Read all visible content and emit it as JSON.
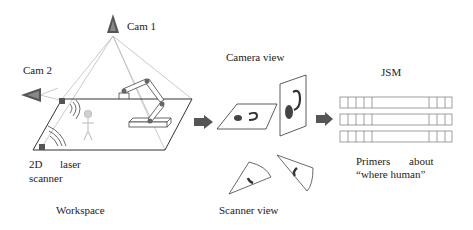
{
  "workspace": {
    "cam1_label": "Cam 1",
    "cam2_label": "Cam 2",
    "laser_label_line1_a": "2D",
    "laser_label_line1_b": "laser",
    "laser_label_line2": "scanner",
    "caption": "Workspace"
  },
  "camera_view": {
    "title": "Camera view"
  },
  "scanner_view": {
    "caption": "Scanner view"
  },
  "jsm": {
    "title": "JSM",
    "rows": 3,
    "caption_line1_a": "Primers",
    "caption_line1_b": "about",
    "caption_line2": "“where human”"
  },
  "colors": {
    "camera_fill": "#555555",
    "arrow_fill": "#555555",
    "line": "#333333",
    "fov_line": "#bbbbbb",
    "human": "#c8c8c8"
  }
}
